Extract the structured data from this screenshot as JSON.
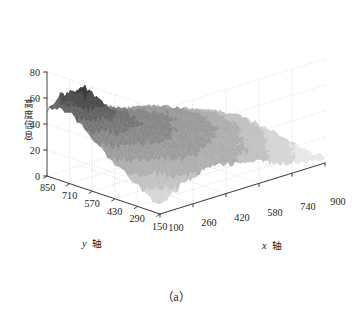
{
  "figure": {
    "caption": "（a）",
    "background_color": "#ffffff",
    "axis_color": "#1a1a1a",
    "grid_color": "#bdbdbd"
  },
  "chart_data": {
    "type": "surface",
    "title": "",
    "subtitle": "",
    "xlabel": "x 轴",
    "ylabel": "y 轴",
    "zlabel": "高度信息",
    "xlabel_latin": "x",
    "xlabel_cjk": "轴",
    "ylabel_latin": "y",
    "ylabel_cjk": "轴",
    "zlabel_cjk": "高度信息",
    "grid": true,
    "legend": null,
    "colormap": "gray",
    "colormap_low": "#2b2b2b",
    "colormap_high": "#e8e8e8",
    "projection": "3d",
    "xlim": [
      100,
      900
    ],
    "ylim": [
      150,
      850
    ],
    "zlim": [
      0,
      80
    ],
    "xticks": [
      100,
      260,
      420,
      580,
      740,
      900
    ],
    "yticks": [
      850,
      710,
      570,
      430,
      290,
      150
    ],
    "zticks": [
      0,
      20,
      40,
      60,
      80
    ],
    "xtick_labels": [
      "100",
      "260",
      "420",
      "580",
      "740",
      "900"
    ],
    "ytick_labels": [
      "850",
      "710",
      "570",
      "430",
      "290",
      "150"
    ],
    "ztick_labels": [
      "0",
      "20",
      "40",
      "60",
      "80"
    ],
    "z_grid": [
      [
        52,
        55,
        58,
        56,
        50,
        46,
        44,
        42,
        40,
        38,
        36,
        34,
        33,
        32,
        31,
        30,
        28,
        26,
        24,
        22,
        20,
        18,
        16,
        14,
        12,
        10
      ],
      [
        54,
        58,
        62,
        60,
        54,
        48,
        45,
        43,
        41,
        39,
        37,
        35,
        34,
        33,
        32,
        31,
        29,
        27,
        25,
        23,
        21,
        19,
        17,
        15,
        13,
        11
      ],
      [
        56,
        61,
        66,
        64,
        57,
        50,
        46,
        44,
        42,
        40,
        38,
        36,
        35,
        34,
        33,
        32,
        30,
        28,
        26,
        24,
        22,
        20,
        18,
        16,
        14,
        12
      ],
      [
        55,
        60,
        70,
        67,
        58,
        51,
        47,
        45,
        43,
        41,
        39,
        37,
        36,
        35,
        34,
        33,
        31,
        29,
        27,
        25,
        23,
        21,
        19,
        17,
        15,
        13
      ],
      [
        50,
        56,
        64,
        62,
        56,
        50,
        47,
        45,
        43,
        41,
        39,
        38,
        37,
        36,
        35,
        34,
        32,
        30,
        28,
        26,
        24,
        22,
        20,
        18,
        16,
        14
      ],
      [
        45,
        50,
        58,
        58,
        54,
        49,
        46,
        44,
        42,
        41,
        39,
        38,
        37,
        36,
        35,
        34,
        32,
        30,
        28,
        26,
        24,
        22,
        20,
        18,
        16,
        13
      ],
      [
        40,
        44,
        50,
        52,
        50,
        47,
        45,
        43,
        41,
        40,
        38,
        37,
        36,
        35,
        34,
        33,
        31,
        29,
        27,
        25,
        23,
        21,
        19,
        17,
        15,
        12
      ],
      [
        36,
        39,
        44,
        46,
        46,
        45,
        43,
        42,
        40,
        39,
        37,
        36,
        35,
        34,
        33,
        32,
        30,
        28,
        26,
        24,
        22,
        20,
        18,
        16,
        14,
        11
      ],
      [
        32,
        35,
        39,
        41,
        42,
        42,
        41,
        40,
        39,
        38,
        36,
        35,
        34,
        33,
        32,
        31,
        29,
        27,
        25,
        23,
        21,
        19,
        17,
        15,
        13,
        10
      ],
      [
        28,
        31,
        35,
        37,
        38,
        39,
        39,
        38,
        37,
        36,
        35,
        34,
        33,
        32,
        31,
        30,
        28,
        26,
        24,
        22,
        20,
        18,
        16,
        14,
        12,
        9
      ],
      [
        24,
        27,
        31,
        33,
        35,
        36,
        36,
        36,
        35,
        34,
        33,
        32,
        31,
        30,
        29,
        28,
        26,
        24,
        22,
        20,
        18,
        16,
        14,
        12,
        10,
        8
      ],
      [
        20,
        23,
        27,
        29,
        31,
        33,
        34,
        34,
        33,
        32,
        31,
        30,
        29,
        28,
        27,
        26,
        24,
        22,
        20,
        18,
        16,
        14,
        12,
        10,
        8,
        6
      ],
      [
        16,
        19,
        23,
        26,
        28,
        30,
        31,
        31,
        31,
        30,
        29,
        28,
        27,
        26,
        25,
        24,
        22,
        20,
        18,
        16,
        14,
        12,
        10,
        8,
        6,
        5
      ],
      [
        12,
        15,
        19,
        22,
        25,
        27,
        28,
        29,
        29,
        28,
        27,
        26,
        25,
        24,
        23,
        22,
        20,
        18,
        16,
        14,
        12,
        10,
        8,
        6,
        5,
        4
      ],
      [
        9,
        12,
        16,
        19,
        22,
        24,
        26,
        27,
        27,
        26,
        25,
        24,
        23,
        22,
        21,
        20,
        18,
        16,
        14,
        12,
        10,
        8,
        6,
        5,
        4,
        3
      ],
      [
        6,
        9,
        13,
        16,
        19,
        21,
        23,
        24,
        25,
        24,
        23,
        22,
        21,
        20,
        19,
        18,
        16,
        14,
        12,
        10,
        8,
        7,
        6,
        5,
        4,
        3
      ]
    ]
  }
}
